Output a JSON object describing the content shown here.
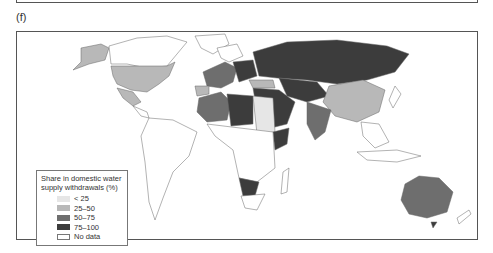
{
  "panel_label": "(f)",
  "legend": {
    "title": "Share in domestic water supply withdrawals (%)",
    "items": [
      {
        "label": "< 25",
        "color": "#e6e6e6"
      },
      {
        "label": "25–50",
        "color": "#b8b8b8"
      },
      {
        "label": "50–75",
        "color": "#6e6e6e"
      },
      {
        "label": "75–100",
        "color": "#3c3c3c"
      },
      {
        "label": "No data",
        "color": "#ffffff"
      }
    ]
  },
  "map": {
    "type": "choropleth world map",
    "colors": {
      "lt25": "#e6e6e6",
      "c25_50": "#b8b8b8",
      "c50_75": "#6e6e6e",
      "c75_100": "#3c3c3c",
      "nodata": "#ffffff",
      "border": "#666666"
    }
  }
}
